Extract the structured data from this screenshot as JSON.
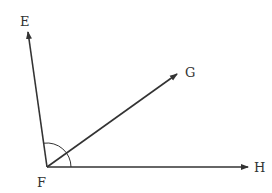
{
  "diagram": {
    "title": "",
    "vertex": {
      "label": "F",
      "x": 47,
      "y": 167,
      "label_x": 37,
      "label_y": 187
    },
    "rays": [
      {
        "id": "FE",
        "label": "E",
        "x": 28,
        "y": 32,
        "label_x": 20,
        "label_y": 26
      },
      {
        "id": "FG",
        "label": "G",
        "x": 177,
        "y": 74,
        "label_x": 185,
        "label_y": 77
      },
      {
        "id": "FH",
        "label": "H",
        "x": 248,
        "y": 167,
        "label_x": 254,
        "label_y": 172
      }
    ],
    "angle_mark": {
      "between": [
        "FE",
        "FH"
      ],
      "radius": 24
    },
    "colors": {
      "line": "#333333",
      "label": "#333333",
      "background": "#ffffff"
    }
  }
}
